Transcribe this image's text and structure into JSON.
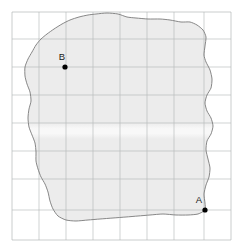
{
  "figure": {
    "caption_partial": "e diagram  —  map",
    "background_color": "#ffffff",
    "width": 244,
    "height": 247
  },
  "grid": {
    "line_color": "#b9bdbd",
    "border_color": "#b2b6b6",
    "cell_size": 27,
    "x_start": 12,
    "y_start": 12,
    "columns": 8,
    "rows": 8,
    "x_lines": [
      12,
      39,
      66,
      93,
      120,
      147,
      174,
      204,
      231
    ],
    "y_lines": [
      12,
      39,
      67,
      95,
      123,
      151,
      179,
      210,
      240
    ]
  },
  "region": {
    "name": "irregular-region",
    "fill_color": "#ececec",
    "stroke_color": "#7b7b7b",
    "stroke_width": 0.9,
    "outline_points": [
      [
        96,
        14
      ],
      [
        107,
        13
      ],
      [
        118,
        14
      ],
      [
        127,
        17
      ],
      [
        136,
        18
      ],
      [
        148,
        19
      ],
      [
        160,
        19
      ],
      [
        170,
        20
      ],
      [
        181,
        22
      ],
      [
        190,
        22
      ],
      [
        197,
        25
      ],
      [
        203,
        30
      ],
      [
        206,
        37
      ],
      [
        205,
        46
      ],
      [
        204,
        55
      ],
      [
        206,
        62
      ],
      [
        210,
        70
      ],
      [
        212,
        79
      ],
      [
        211,
        88
      ],
      [
        207,
        95
      ],
      [
        205,
        103
      ],
      [
        207,
        111
      ],
      [
        211,
        118
      ],
      [
        213,
        126
      ],
      [
        211,
        134
      ],
      [
        207,
        141
      ],
      [
        206,
        150
      ],
      [
        208,
        159
      ],
      [
        210,
        168
      ],
      [
        209,
        177
      ],
      [
        206,
        185
      ],
      [
        204,
        194
      ],
      [
        205,
        203
      ],
      [
        205,
        210
      ],
      [
        198,
        214
      ],
      [
        188,
        215
      ],
      [
        176,
        215
      ],
      [
        163,
        214
      ],
      [
        150,
        215
      ],
      [
        138,
        216
      ],
      [
        126,
        217
      ],
      [
        113,
        218
      ],
      [
        100,
        219
      ],
      [
        88,
        220
      ],
      [
        76,
        221
      ],
      [
        66,
        220
      ],
      [
        58,
        216
      ],
      [
        53,
        209
      ],
      [
        50,
        201
      ],
      [
        48,
        192
      ],
      [
        45,
        184
      ],
      [
        41,
        177
      ],
      [
        38,
        169
      ],
      [
        36,
        161
      ],
      [
        36,
        152
      ],
      [
        35,
        143
      ],
      [
        32,
        135
      ],
      [
        29,
        127
      ],
      [
        28,
        118
      ],
      [
        29,
        109
      ],
      [
        31,
        101
      ],
      [
        30,
        92
      ],
      [
        27,
        84
      ],
      [
        25,
        76
      ],
      [
        25,
        67
      ],
      [
        28,
        59
      ],
      [
        32,
        52
      ],
      [
        36,
        45
      ],
      [
        41,
        39
      ],
      [
        47,
        34
      ],
      [
        54,
        29
      ],
      [
        62,
        24
      ],
      [
        70,
        20
      ],
      [
        79,
        17
      ],
      [
        88,
        15
      ]
    ]
  },
  "points": [
    {
      "id": "point-a",
      "label": "A",
      "x": 205,
      "y": 210,
      "label_x": 199,
      "label_y": 203,
      "color": "#000000",
      "radius": 2.6
    },
    {
      "id": "point-b",
      "label": "B",
      "x": 65,
      "y": 67,
      "label_x": 62,
      "label_y": 60,
      "color": "#000000",
      "radius": 2.6
    }
  ],
  "highlight_band": {
    "name": "light-band",
    "y_top": 123,
    "y_bottom": 139,
    "color": "#f7f7f7"
  }
}
